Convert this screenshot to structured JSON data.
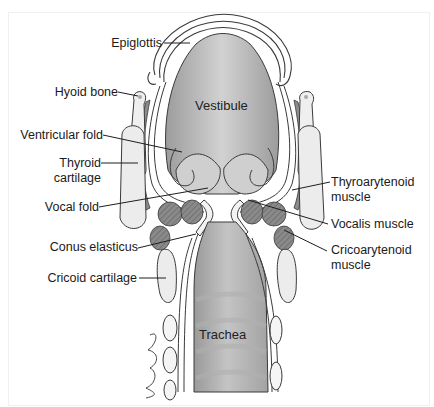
{
  "figure": {
    "signature": "Gregory"
  },
  "labels": {
    "epiglottis": "Epiglottis",
    "hyoid_bone": "Hyoid bone",
    "ventricular_fold": "Ventricular fold",
    "thyroid_cartilage_1": "Thyroid",
    "thyroid_cartilage_2": "cartilage",
    "vocal_fold": "Vocal fold",
    "conus_elasticus": "Conus elasticus",
    "cricoid_cartilage": "Cricoid cartilage",
    "thyroarytenoid_1": "Thyroarytenoid",
    "thyroarytenoid_2": "muscle",
    "vocalis_muscle": "Vocalis muscle",
    "cricoarytenoid_1": "Cricoarytenoid",
    "cricoarytenoid_2": "muscle",
    "vestibule": "Vestibule",
    "trachea": "Trachea"
  },
  "colors": {
    "line": "#3a3a3a",
    "lumen": "#b5b5b5",
    "muscle": "#7a7a7a",
    "cartilage": "#e9e9e9",
    "membrane": "#f7f7f7"
  }
}
